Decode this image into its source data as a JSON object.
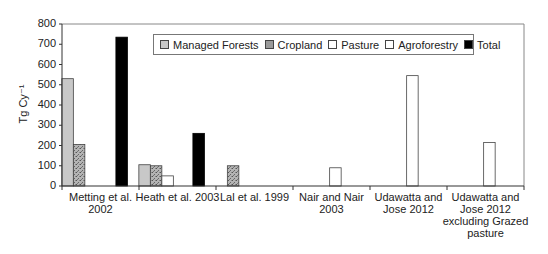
{
  "chart_data": {
    "type": "bar",
    "title": "",
    "xlabel": "",
    "ylabel": "Tg Cy⁻¹",
    "ylim": [
      0,
      800
    ],
    "yticks": [
      0,
      100,
      200,
      300,
      400,
      500,
      600,
      700,
      800
    ],
    "grid": false,
    "legend_position": "top inside",
    "categories": [
      "Metting et al. 2002",
      "Heath et al. 2003",
      "Lal et al. 1999",
      "Nair and Nair 2003",
      "Udawatta and Jose 2012",
      "Udawatta and Jose 2012 excluding Grazed pasture"
    ],
    "category_lines": [
      [
        "Metting et al.",
        "2002"
      ],
      [
        "Heath et al. 2003"
      ],
      [
        "Lal et al. 1999"
      ],
      [
        "Nair and Nair",
        "2003"
      ],
      [
        "Udawatta and",
        "Jose 2012"
      ],
      [
        "Udawatta and",
        "Jose 2012",
        "excluding Grazed",
        "pasture"
      ]
    ],
    "series": [
      {
        "name": "Managed Forests",
        "color": "#c8c8c8",
        "values": [
          530,
          105,
          0,
          0,
          0,
          0
        ]
      },
      {
        "name": "Cropland",
        "color": "#9a9a9a",
        "pattern": "speckled",
        "values": [
          205,
          100,
          100,
          0,
          0,
          0
        ]
      },
      {
        "name": "Pasture",
        "color": "#ffffff",
        "values": [
          0,
          50,
          0,
          0,
          0,
          0
        ]
      },
      {
        "name": "Agroforestry",
        "color": "#ffffff",
        "values": [
          0,
          0,
          0,
          90,
          545,
          215
        ]
      },
      {
        "name": "Total",
        "color": "#000000",
        "values": [
          735,
          260,
          0,
          0,
          0,
          0
        ]
      }
    ]
  }
}
